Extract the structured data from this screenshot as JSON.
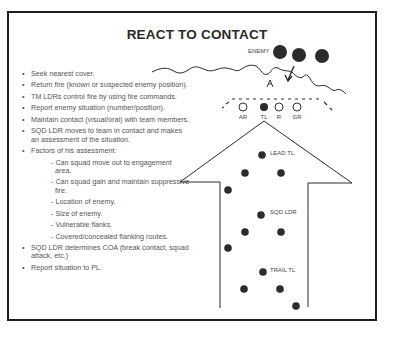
{
  "slide": {
    "title": "REACT TO CONTACT",
    "bullets": [
      {
        "type": "bullet",
        "text": "Seek nearest cover."
      },
      {
        "type": "bullet",
        "text": "Return fire (known or suspected enemy position)."
      },
      {
        "type": "bullet",
        "text": "TM LDRs control fire by using fire commands."
      },
      {
        "type": "bullet",
        "text": "Report enemy situation (number/position)."
      },
      {
        "type": "bullet",
        "text": "Maintain contact (visual/oral) with team members."
      },
      {
        "type": "bullet",
        "text": "SQD LDR moves to team in contact and makes an assessment of the situation."
      },
      {
        "type": "bullet",
        "text": "Factors of his assessment:"
      },
      {
        "type": "sub",
        "text": "- Can squad move out to engagement area."
      },
      {
        "type": "sub",
        "text": "- Can squad gain and maintain suppressive fire."
      },
      {
        "type": "sub",
        "text": "- Location of enemy."
      },
      {
        "type": "sub",
        "text": "- Size of enemy."
      },
      {
        "type": "sub",
        "text": "- Vulnerable flanks."
      },
      {
        "type": "sub",
        "text": "- Covered/concealed flanking routes."
      },
      {
        "type": "bullet",
        "text": "SQD LDR determines COA (break contact, squad attack, etc.)"
      },
      {
        "type": "bullet",
        "text": "Report situation to PL."
      }
    ]
  },
  "diagram": {
    "enemy_label": "ENEMY",
    "team_labels": [
      "AR",
      "TL",
      "R",
      "GR"
    ],
    "lead_label": "LEAD TL",
    "sqd_label": "SQD LDR",
    "trail_label": "TRAIL TL",
    "colors": {
      "line": "#2a2a2a",
      "dot": "#2b2b2b",
      "frame": "#1e1e1e"
    }
  }
}
